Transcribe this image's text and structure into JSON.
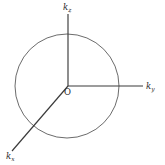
{
  "figure": {
    "kind": "k-space-axes-with-circle",
    "background_color": "#ffffff",
    "stroke_color_axes": "#3a3a3a",
    "stroke_color_circle": "#555555",
    "text_color": "#2b2b2b",
    "origin": {
      "label": "O",
      "x": 68,
      "y": 86
    },
    "circle": {
      "center_x": 67,
      "center_y": 86,
      "radius": 52
    },
    "axes": [
      {
        "name": "k-z-axis",
        "symbol": "k",
        "subscript": "z",
        "label": "kz",
        "direction": "up",
        "from_x": 68,
        "from_y": 86,
        "to_x": 68,
        "to_y": 14
      },
      {
        "name": "k-y-axis",
        "symbol": "k",
        "subscript": "y",
        "label": "ky",
        "direction": "right",
        "from_x": 68,
        "from_y": 86,
        "to_x": 143,
        "to_y": 86
      },
      {
        "name": "k-x-axis",
        "symbol": "k",
        "subscript": "x",
        "label": "kx",
        "direction": "lower-left",
        "from_x": 68,
        "from_y": 86,
        "to_x": 12,
        "to_y": 151
      }
    ]
  }
}
